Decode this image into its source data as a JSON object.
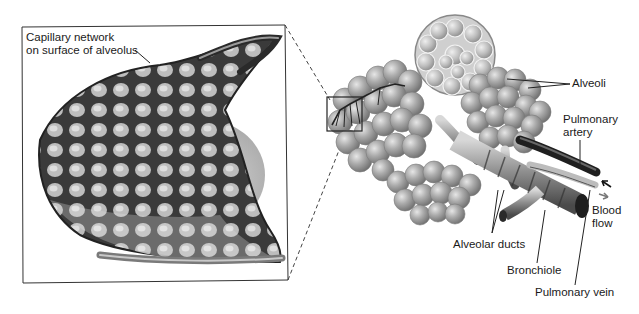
{
  "figure": {
    "inset": {
      "label": "Capillary network on surface of alveolus",
      "label_line1": "Capillary network",
      "label_line2": "on surface of alveolus"
    },
    "labels": {
      "alveoli": "Alveoli",
      "pulmonary_artery_line1": "Pulmonary",
      "pulmonary_artery_line2": "artery",
      "blood_flow_line1": "Blood",
      "blood_flow_line2": "flow",
      "alveolar_ducts": "Alveolar ducts",
      "bronchiole": "Bronchiole",
      "pulmonary_vein": "Pulmonary vein"
    },
    "colors": {
      "background": "#ffffff",
      "ink": "#1a1a1a",
      "alveolus_fill": "#a9a9a9",
      "alveolus_highlight": "#d9d9d9",
      "capillary_dark": "#2a2a2a",
      "capillary_mid": "#7a7a7a",
      "bronchiole": "#8c8c8c",
      "artery": "#222222",
      "vein": "#b0b0b0"
    }
  }
}
